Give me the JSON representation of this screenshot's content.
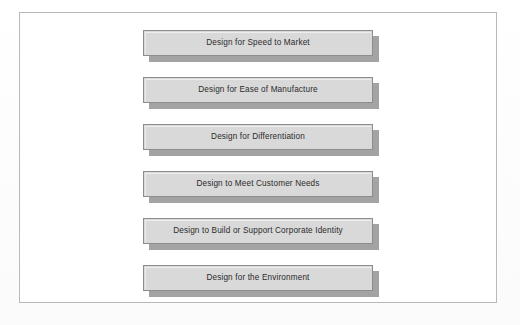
{
  "figure": {
    "kind": "block-list-diagram",
    "title": "",
    "frame": {
      "border_color": "#b9b9b9",
      "background_color": "#ffffff"
    },
    "style": {
      "box_fill_color": "#d9d9d9",
      "box_border_color": "#8d8d8d",
      "box_shadow_color": "#a3a3a3",
      "text_color": "#2b2b2b",
      "page_background_color": "#fdfdfd"
    },
    "boxes": [
      {
        "label": "Design for Speed to Market"
      },
      {
        "label": "Design for Ease of Manufacture"
      },
      {
        "label": "Design for Differentiation"
      },
      {
        "label": "Design to Meet Customer Needs"
      },
      {
        "label": "Design to Build or Support Corporate Identity"
      },
      {
        "label": "Design for the Environment"
      }
    ]
  }
}
